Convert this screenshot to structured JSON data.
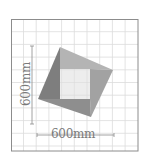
{
  "diagram": {
    "frame": {
      "x": 11,
      "y": 19,
      "width": 127,
      "height": 132,
      "stroke": "#8c8c8c"
    },
    "grid": {
      "spacing": 12.7,
      "color": "#d9d9d9",
      "vertical_lines": [
        23.5,
        36.2,
        48.9,
        61.6,
        74.3,
        87,
        99.7,
        112.4,
        125.1
      ],
      "horizontal_lines": [
        31.7,
        44.4,
        57.1,
        69.8,
        82.5,
        95.2,
        107.9,
        120.6,
        133.3,
        146
      ]
    },
    "rotated_square": {
      "vertices": {
        "top": [
          60,
          47
        ],
        "right": [
          113,
          70
        ],
        "bottom": [
          91,
          117
        ],
        "left": [
          38,
          99
        ]
      },
      "colors": {
        "top_face": "#a8a8a8",
        "right_face": "#9a9a9a",
        "bottom_face": "#8a8a8a",
        "left_face": "#7c7c7c"
      }
    },
    "inner_rectangle": {
      "x": 60,
      "y": 69,
      "width": 30,
      "height": 30,
      "color": "#ececec"
    },
    "dimensions": {
      "horizontal": {
        "label": "600mm",
        "line": {
          "x1": 37,
          "x2": 114,
          "y": 135
        }
      },
      "vertical": {
        "label": "600mm",
        "line": {
          "x": 32,
          "y1": 46,
          "y2": 124
        }
      },
      "line_color": "#8a8a8a"
    }
  }
}
